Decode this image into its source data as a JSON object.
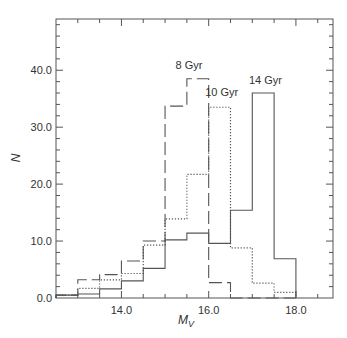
{
  "chart_data": {
    "type": "histogram-step",
    "title": "",
    "xlabel": "M",
    "xlabel_subscript": "V",
    "ylabel": "N",
    "xlim": [
      12.5,
      18.85
    ],
    "ylim": [
      0,
      49
    ],
    "grid": false,
    "legend": "inline labels near peaks",
    "x_ticks": [
      {
        "value": 14.0,
        "label": "14.0"
      },
      {
        "value": 16.0,
        "label": "16.0"
      },
      {
        "value": 18.0,
        "label": "18.0"
      }
    ],
    "x_minor_step": 0.5,
    "y_ticks": [
      {
        "value": 0,
        "label": "0.0"
      },
      {
        "value": 10,
        "label": "10.0"
      },
      {
        "value": 20,
        "label": "20.0"
      },
      {
        "value": 30,
        "label": "30.0"
      },
      {
        "value": 40,
        "label": "40.0"
      }
    ],
    "y_minor_step": 2,
    "bin_edges": [
      12.5,
      13.0,
      13.5,
      14.0,
      14.5,
      15.0,
      15.5,
      16.0,
      16.5,
      17.0,
      17.5,
      18.0
    ],
    "series": [
      {
        "name": "8 Gyr",
        "style": "dashed",
        "values": [
          0.5,
          3.2,
          4.1,
          6.5,
          10.0,
          33.7,
          38.5,
          2.7,
          0,
          0,
          0
        ],
        "label": "8 Gyr",
        "label_pos": {
          "x": 15.55,
          "y": 40.3
        }
      },
      {
        "name": "10 Gyr",
        "style": "dotted",
        "values": [
          0.5,
          1.7,
          3.2,
          4.3,
          9.3,
          13.9,
          21.7,
          33.5,
          8.8,
          2.6,
          1.0
        ],
        "label": "10 Gyr",
        "label_pos": {
          "x": 16.3,
          "y": 35.5
        }
      },
      {
        "name": "14 Gyr",
        "style": "solid",
        "values": [
          0.5,
          0.7,
          1.6,
          3.0,
          5.2,
          10.2,
          11.4,
          9.6,
          15.4,
          36.0,
          6.9
        ],
        "label": "14 Gyr",
        "label_pos": {
          "x": 17.3,
          "y": 37.6
        }
      }
    ]
  },
  "colors": {
    "line": "#555555",
    "frame": "#555555",
    "text": "#333333"
  }
}
